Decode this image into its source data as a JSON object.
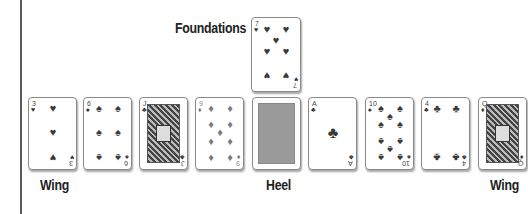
{
  "labels": {
    "foundations": "Foundations",
    "wing_left": "Wing",
    "heel": "Heel",
    "wing_right": "Wing"
  },
  "foundation": {
    "card": {
      "rank": "7",
      "suit": "♥",
      "suit_name": "hearts"
    }
  },
  "tableau": [
    {
      "rank": "3",
      "suit": "♥",
      "suit_name": "hearts",
      "role": "wing"
    },
    {
      "rank": "6",
      "suit": "♠",
      "suit_name": "spades"
    },
    {
      "rank": "J",
      "suit": "♣",
      "suit_name": "clubs"
    },
    {
      "rank": "9",
      "suit": "♦",
      "suit_name": "diamonds"
    },
    {
      "rank": "",
      "suit": "",
      "suit_name": "face-down",
      "role": "heel"
    },
    {
      "rank": "A",
      "suit": "♣",
      "suit_name": "clubs"
    },
    {
      "rank": "10",
      "suit": "♠",
      "suit_name": "spades"
    },
    {
      "rank": "4",
      "suit": "♣",
      "suit_name": "clubs"
    },
    {
      "rank": "Q",
      "suit": "♦",
      "suit_name": "diamonds",
      "role": "wing"
    }
  ]
}
